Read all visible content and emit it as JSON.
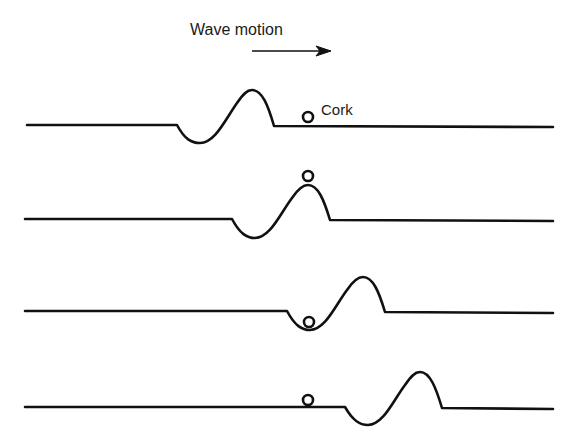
{
  "diagram": {
    "title": "Wave motion",
    "direction_arrow": "right-arrow",
    "object_label": "Cork",
    "colors": {
      "ink": "#111111",
      "background": "#ffffff"
    },
    "frames": [
      {
        "index": 1,
        "baseline_y": 126,
        "pulse_start_x": 177,
        "trough": [
          200,
          143
        ],
        "crest": [
          252,
          90
        ],
        "pulse_end_x": 274,
        "cork": [
          308,
          117
        ],
        "cork_position": "on flat water ahead of pulse"
      },
      {
        "index": 2,
        "baseline_y": 220,
        "pulse_start_x": 232,
        "trough": [
          255,
          238
        ],
        "crest": [
          308,
          185
        ],
        "pulse_end_x": 330,
        "cork": [
          308,
          176
        ],
        "cork_position": "on crest"
      },
      {
        "index": 3,
        "baseline_y": 312,
        "pulse_start_x": 287,
        "trough": [
          310,
          330
        ],
        "crest": [
          363,
          277
        ],
        "pulse_end_x": 385,
        "cork": [
          309,
          322
        ],
        "cork_position": "in trough"
      },
      {
        "index": 4,
        "baseline_y": 407,
        "pulse_start_x": 345,
        "trough": [
          368,
          425
        ],
        "crest": [
          420,
          372
        ],
        "pulse_end_x": 442,
        "cork": [
          308,
          400
        ],
        "cork_position": "on flat water behind pulse"
      }
    ]
  }
}
